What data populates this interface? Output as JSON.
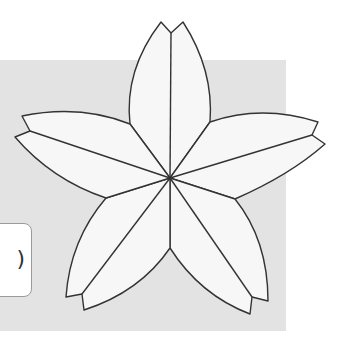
{
  "diagram": {
    "type": "five-petal flower (sakura) outline",
    "background_panel_color": "#e3e3e3",
    "petal_fill": "#f7f7f7",
    "stroke_color": "#333333",
    "label_box": {
      "text": ")"
    },
    "center": [
      170,
      178
    ],
    "petals": [
      {
        "name": "top",
        "tips": [
          [
            161,
            22
          ],
          [
            183,
            22
          ]
        ],
        "notch": [
          171,
          33
        ]
      },
      {
        "name": "right",
        "tips": [
          [
            318,
            122
          ],
          [
            325,
            144
          ]
        ],
        "notch": [
          312,
          135
        ]
      },
      {
        "name": "bottom-right",
        "tips": [
          [
            268,
            301
          ],
          [
            250,
            314
          ]
        ],
        "notch": [
          252,
          297
        ]
      },
      {
        "name": "bottom-left",
        "tips": [
          [
            84,
            310
          ],
          [
            66,
            297
          ]
        ],
        "notch": [
          82,
          294
        ]
      },
      {
        "name": "left",
        "tips": [
          [
            15,
            137
          ],
          [
            22,
            116
          ]
        ],
        "notch": [
          30,
          131
        ]
      }
    ],
    "junctions": [
      [
        210,
        122
      ],
      [
        235,
        199
      ],
      [
        170,
        248
      ],
      [
        106,
        198
      ],
      [
        130,
        124
      ]
    ]
  }
}
